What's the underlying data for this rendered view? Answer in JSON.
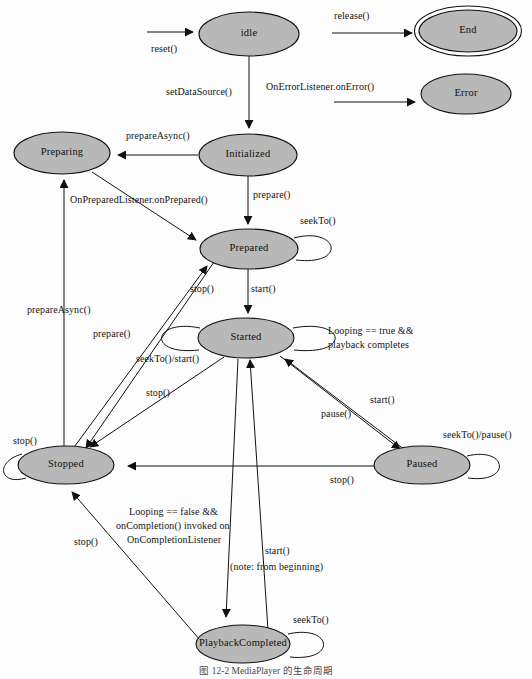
{
  "figure": {
    "caption": "图 12-2  MediaPlayer 的生命周期",
    "background_color": "#fdfdfd",
    "state_fill_color": "#b8b8b8",
    "stroke_color": "#111111"
  },
  "states": [
    {
      "id": "idle",
      "label": "idle",
      "cx": 249,
      "cy": 34,
      "rx": 50,
      "ry": 22,
      "final": false
    },
    {
      "id": "end",
      "label": "End",
      "cx": 468,
      "cy": 31,
      "rx": 49,
      "ry": 21,
      "final": true
    },
    {
      "id": "error",
      "label": "Error",
      "cx": 466,
      "cy": 94,
      "rx": 45,
      "ry": 20,
      "final": false
    },
    {
      "id": "preparing",
      "label": "Preparing",
      "cx": 62,
      "cy": 153,
      "rx": 48,
      "ry": 21,
      "final": false
    },
    {
      "id": "initialized",
      "label": "Initialized",
      "cx": 248,
      "cy": 155,
      "rx": 49,
      "ry": 21,
      "final": false
    },
    {
      "id": "prepared",
      "label": "Prepared",
      "cx": 249,
      "cy": 249,
      "rx": 49,
      "ry": 20,
      "final": false
    },
    {
      "id": "started",
      "label": "Started",
      "cx": 246,
      "cy": 338,
      "rx": 48,
      "ry": 20,
      "final": false
    },
    {
      "id": "stopped",
      "label": "Stopped",
      "cx": 66,
      "cy": 465,
      "rx": 48,
      "ry": 19,
      "final": false
    },
    {
      "id": "paused",
      "label": "Paused",
      "cx": 422,
      "cy": 465,
      "rx": 48,
      "ry": 19,
      "final": false
    },
    {
      "id": "playbackcompleted",
      "label": "PlaybackCompleted",
      "cx": 243,
      "cy": 644,
      "rx": 47,
      "ry": 19,
      "final": false
    }
  ],
  "transitions": [
    {
      "id": "t-reset",
      "label": "reset()",
      "from": "(start)",
      "to": "idle"
    },
    {
      "id": "t-release",
      "label": "release()",
      "from": "(any)",
      "to": "end"
    },
    {
      "id": "t-onerror",
      "label": "OnErrorListener.onError()",
      "from": "(any)",
      "to": "error"
    },
    {
      "id": "t-setdatasource",
      "label": "setDataSource()",
      "from": "idle",
      "to": "initialized"
    },
    {
      "id": "t-prepareasync-init",
      "label": "prepareAsync()",
      "from": "initialized",
      "to": "preparing"
    },
    {
      "id": "t-prepare",
      "label": "prepare()",
      "from": "initialized",
      "to": "prepared"
    },
    {
      "id": "t-onprepared",
      "label": "OnPreparedListener.onPrepared()",
      "from": "preparing",
      "to": "prepared"
    },
    {
      "id": "t-seekto-prepared",
      "label": "seekTo()",
      "from": "prepared",
      "to": "prepared"
    },
    {
      "id": "t-start",
      "label": "start()",
      "from": "prepared",
      "to": "started"
    },
    {
      "id": "t-stop-prepared",
      "label": "stop()",
      "from": "prepared",
      "to": "stopped"
    },
    {
      "id": "t-prepareasync-stopped",
      "label": "prepareAsync()",
      "from": "stopped",
      "to": "preparing"
    },
    {
      "id": "t-prepare-stopped",
      "label": "prepare()",
      "from": "stopped",
      "to": "prepared"
    },
    {
      "id": "t-seekto-start",
      "label": "seekTo()/start()",
      "from": "started",
      "to": "started"
    },
    {
      "id": "t-looping-true",
      "label": "Looping == true &&\nplayback completes",
      "from": "started",
      "to": "started"
    },
    {
      "id": "t-stop-started",
      "label": "stop()",
      "from": "started",
      "to": "stopped"
    },
    {
      "id": "t-pause",
      "label": "pause()",
      "from": "started",
      "to": "paused"
    },
    {
      "id": "t-start-paused",
      "label": "start()",
      "from": "paused",
      "to": "started"
    },
    {
      "id": "t-seekto-pause",
      "label": "seekTo()/pause()",
      "from": "paused",
      "to": "paused"
    },
    {
      "id": "t-stop-paused",
      "label": "stop()",
      "from": "paused",
      "to": "stopped"
    },
    {
      "id": "t-stop-stopped",
      "label": "stop()",
      "from": "stopped",
      "to": "stopped"
    },
    {
      "id": "t-oncompletion",
      "label": "Looping == false &&\nonCompletion() invoked on\nOnCompletionListener",
      "from": "started",
      "to": "playbackcompleted"
    },
    {
      "id": "t-start-from-beginning",
      "label": "start()\n(note: from beginning)",
      "from": "playbackcompleted",
      "to": "started"
    },
    {
      "id": "t-stop-playbackcompleted",
      "label": "stop()",
      "from": "playbackcompleted",
      "to": "stopped"
    },
    {
      "id": "t-seekto-playbackcompleted",
      "label": "seekTo()",
      "from": "playbackcompleted",
      "to": "playbackcompleted"
    }
  ],
  "labels": {
    "idle": "idle",
    "end": "End",
    "error": "Error",
    "preparing": "Preparing",
    "initialized": "Initialized",
    "prepared": "Prepared",
    "started": "Started",
    "stopped": "Stopped",
    "paused": "Paused",
    "playbackcompleted": "PlaybackCompleted",
    "reset": "reset()",
    "release": "release()",
    "on_error": "OnErrorListener.onError()",
    "set_data_source": "setDataSource()",
    "prepare_async_top": "prepareAsync()",
    "prepare_async_left": "prepareAsync()",
    "on_prepared": "OnPreparedListener.onPrepared()",
    "prepare_top": "prepare()",
    "prepare_left": "prepare()",
    "seek_to_prepared": "seekTo()",
    "start_prepared": "start()",
    "stop_prepared": "stop()",
    "seek_to_start": "seekTo()/start()",
    "stop_started": "stop()",
    "looping_true_line1": "Looping == true &&",
    "looping_true_line2": "playback completes",
    "pause": "pause()",
    "start_paused": "start()",
    "seek_to_pause": "seekTo()/pause()",
    "stop_paused": "stop()",
    "stop_stopped": "stop()",
    "stop_playback_completed": "stop()",
    "oncompletion_line1": "Looping == false &&",
    "oncompletion_line2": "onCompletion() invoked on",
    "oncompletion_line3": "OnCompletionListener",
    "start_from_beginning_line1": "start()",
    "start_from_beginning_line2": "(note: from beginning)",
    "seek_to_playback_completed": "seekTo()"
  }
}
